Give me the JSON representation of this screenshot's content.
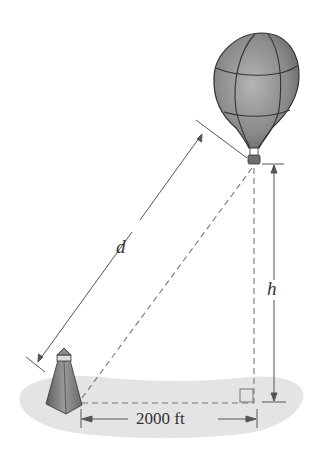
{
  "diagram": {
    "labels": {
      "distance": "d",
      "height": "h",
      "horizontal": "2000 ft"
    },
    "objects": [
      "hot-air-balloon",
      "lighthouse",
      "ground"
    ],
    "right_angle": true,
    "colors": {
      "line": "#555555",
      "ground": "#e6e6e6",
      "balloon": "#8a8a8a",
      "lighthouse": "#7a7a7a"
    }
  }
}
